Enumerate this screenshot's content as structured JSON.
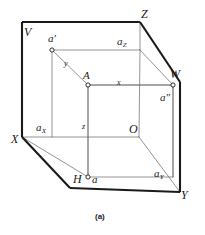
{
  "figure": {
    "caption": "(a)",
    "stroke_color": "#1a1a1a",
    "thin_stroke_color": "#555555",
    "background": "#ffffff"
  },
  "planes": [
    {
      "key": "V",
      "label": "V"
    },
    {
      "key": "H",
      "label": "H"
    },
    {
      "key": "W",
      "label": "W"
    }
  ],
  "axes": [
    {
      "key": "X",
      "label": "X"
    },
    {
      "key": "Y",
      "label": "Y"
    },
    {
      "key": "Z",
      "label": "Z"
    },
    {
      "key": "O",
      "label": "O"
    }
  ],
  "points": [
    {
      "key": "A",
      "label": "A"
    },
    {
      "key": "a_front",
      "label": "a′"
    },
    {
      "key": "a_top",
      "label": "a"
    },
    {
      "key": "a_side",
      "label": "a″"
    }
  ],
  "foot_labels": [
    {
      "key": "aX",
      "base": "a",
      "sub": "X"
    },
    {
      "key": "aY",
      "base": "a",
      "sub": "Y"
    },
    {
      "key": "aZ",
      "base": "a",
      "sub": "Z"
    }
  ],
  "coordinates": [
    {
      "key": "x",
      "label": "x"
    },
    {
      "key": "y",
      "label": "y"
    },
    {
      "key": "z",
      "label": "z"
    }
  ]
}
